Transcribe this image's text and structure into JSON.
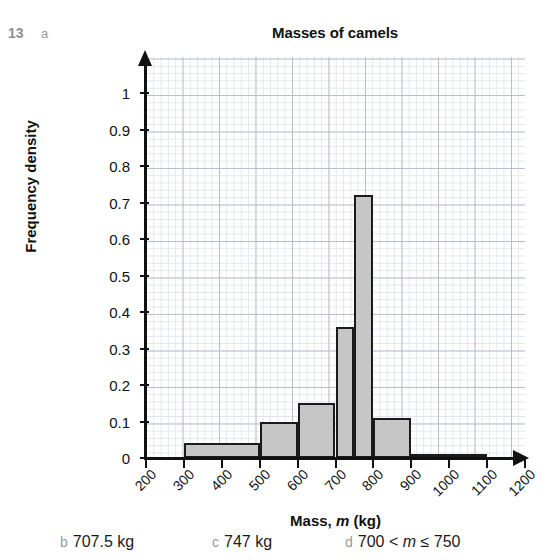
{
  "exercise": {
    "number": "13",
    "part": "a"
  },
  "chart_data": {
    "type": "bar",
    "title": "Masses of camels",
    "xlabel_prefix": "Mass, ",
    "xlabel_var": "m",
    "xlabel_suffix": " (kg)",
    "ylabel": "Frequency density",
    "xlim": [
      200,
      1200
    ],
    "ylim": [
      0,
      1.1
    ],
    "grid": true,
    "legend": null,
    "xticks": [
      200,
      300,
      400,
      500,
      600,
      700,
      800,
      900,
      1000,
      1100,
      1200
    ],
    "xtick_labels": [
      "200",
      "300",
      "400",
      "500",
      "600",
      "700",
      "800",
      "900",
      "1000",
      "1100",
      "1200"
    ],
    "yticks": [
      0,
      0.1,
      0.2,
      0.3,
      0.4,
      0.5,
      0.6,
      0.7,
      0.8,
      0.9,
      1
    ],
    "ytick_labels": [
      "0",
      "0.1",
      "0.2",
      "0.3",
      "0.4",
      "0.5",
      "0.6",
      "0.7",
      "0.8",
      "0.9",
      "1"
    ],
    "bar_fill": "#c6c6c6",
    "bar_edge": "#1a1a1a",
    "bins": [
      {
        "label": "300 < m ≤ 500",
        "x0": 300,
        "x1": 500,
        "value": 0.04
      },
      {
        "label": "500 < m ≤ 600",
        "x0": 500,
        "x1": 600,
        "value": 0.1
      },
      {
        "label": "600 < m ≤ 700",
        "x0": 600,
        "x1": 700,
        "value": 0.15
      },
      {
        "label": "700 < m ≤ 750",
        "x0": 700,
        "x1": 750,
        "value": 0.36
      },
      {
        "label": "750 < m ≤ 800",
        "x0": 750,
        "x1": 800,
        "value": 0.72
      },
      {
        "label": "800 < m ≤ 900",
        "x0": 800,
        "x1": 900,
        "value": 0.11
      },
      {
        "label": "900 < m ≤ 1100",
        "x0": 900,
        "x1": 1100,
        "value": 0.01
      }
    ]
  },
  "answers": [
    {
      "tag": "b",
      "text": "707.5 kg"
    },
    {
      "tag": "c",
      "text": "747 kg"
    },
    {
      "tag": "d",
      "text": "700 < m ≤ 750",
      "math": true
    }
  ]
}
